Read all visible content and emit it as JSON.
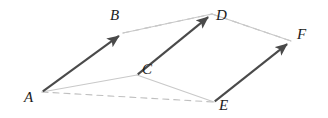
{
  "figure": {
    "canvas": {
      "width": 328,
      "height": 118
    },
    "background_color": "#ffffff",
    "colors": {
      "arrow_dark": "#4a4a4a",
      "edge_light": "#c9c9c9",
      "dashed_gray": "#bfbfbf",
      "label_text": "#1c1c1c"
    },
    "vertices": [
      {
        "id": "A",
        "label": "A",
        "x": 42,
        "y": 92,
        "label_x": 24,
        "label_y": 90
      },
      {
        "id": "B",
        "label": "B",
        "x": 123,
        "y": 33,
        "label_x": 110,
        "label_y": 8
      },
      {
        "id": "C",
        "label": "C",
        "x": 137,
        "y": 75,
        "label_x": 142,
        "label_y": 62
      },
      {
        "id": "D",
        "label": "D",
        "x": 212,
        "y": 14,
        "label_x": 216,
        "label_y": 8
      },
      {
        "id": "E",
        "label": "E",
        "x": 214,
        "y": 102,
        "label_x": 219,
        "label_y": 98
      },
      {
        "id": "F",
        "label": "F",
        "x": 291,
        "y": 41,
        "label_x": 297,
        "label_y": 27
      }
    ],
    "vectors": [
      {
        "id": "AB",
        "from": "A",
        "to": "B",
        "style": "arrow-dark"
      },
      {
        "id": "CD",
        "from": "C",
        "to": "D",
        "style": "arrow-dark"
      },
      {
        "id": "EF",
        "from": "E",
        "to": "F",
        "style": "arrow-dark"
      }
    ],
    "edges": [
      {
        "id": "AC",
        "from": "A",
        "to": "C",
        "style": "solid-light"
      },
      {
        "id": "CE",
        "from": "C",
        "to": "E",
        "style": "solid-light"
      },
      {
        "id": "BD",
        "from": "B",
        "to": "D",
        "style": "solid-light"
      },
      {
        "id": "DF",
        "from": "D",
        "to": "F",
        "style": "solid-light"
      },
      {
        "id": "BD-hidden",
        "from": "B",
        "to": "D",
        "style": "dashed"
      },
      {
        "id": "DF-hidden",
        "from": "D",
        "to": "F",
        "style": "dashed"
      },
      {
        "id": "AE-hidden",
        "from": "A",
        "to": "E",
        "style": "dashed"
      }
    ]
  }
}
